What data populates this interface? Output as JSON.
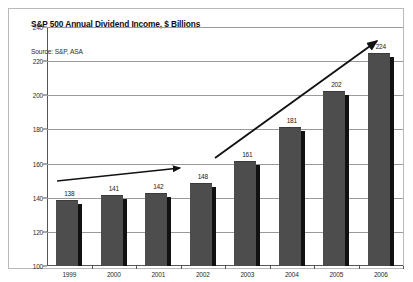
{
  "chart_data": {
    "type": "bar",
    "title": "S&P 500 Annual Dividend Income, $ Billions",
    "source": "Source: S&P, ASA",
    "xlabel": "",
    "ylabel": "",
    "categories": [
      "1999",
      "2000",
      "2001",
      "2002",
      "2003",
      "2004",
      "2005",
      "2006"
    ],
    "values": [
      138,
      141,
      142,
      148,
      161,
      181,
      202,
      224
    ],
    "ylim": [
      100,
      240
    ],
    "yticks": [
      100,
      120,
      140,
      160,
      180,
      200,
      220,
      240
    ],
    "ytick_labels": [
      "100",
      "120",
      "140",
      "160",
      "180",
      "200",
      "220",
      "240"
    ],
    "grid": true,
    "legend": false,
    "bar_color": "#4d4d4d",
    "gridline_color": "#9a9a9a",
    "annotations": [
      {
        "name": "trend-arrow-1999-2002",
        "type": "arrow",
        "from": {
          "x": "1999",
          "y": 148
        },
        "to": {
          "x": "2002",
          "y": 152
        },
        "note": "shallow trend arrow over 1999-2002 bars"
      },
      {
        "name": "trend-arrow-2003-2006",
        "type": "arrow",
        "from": {
          "x": "2003",
          "y": 161
        },
        "to": {
          "x": "2006",
          "y": 232
        },
        "note": "steep trend arrow over 2003-2006 bars"
      }
    ]
  }
}
